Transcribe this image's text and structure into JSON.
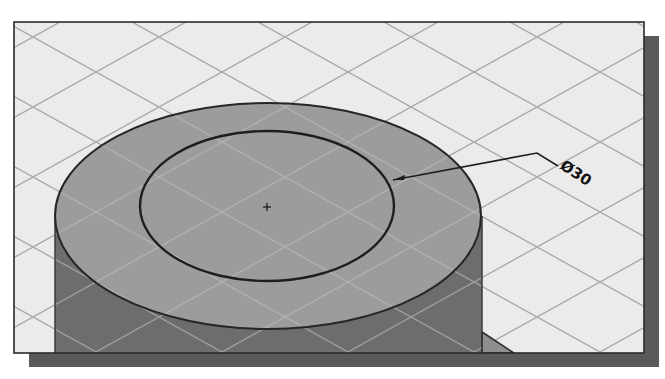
{
  "viewport": {
    "title": "3D model viewport - isometric cylinder sketch",
    "frame": {
      "x": 14,
      "y": 22,
      "width": 630,
      "height": 331
    },
    "shadow": {
      "offset_x": 15,
      "offset_y": 14
    }
  },
  "colors": {
    "background": "#ebebeb",
    "grid_line": "#a8a8a8",
    "frame_border": "#2b2b2b",
    "shadow": "#5a5a5a",
    "cylinder_top": "#9c9c9c",
    "cylinder_side": "#6d6d6d",
    "flange": "#8e8e8e",
    "sketch_line": "#1e1e1e",
    "grid_on_model": "#b6b6b6"
  },
  "model": {
    "outer_top": {
      "cx": 268,
      "cy": 216,
      "rx": 213,
      "ry": 113
    },
    "inner_circle": {
      "cx": 267,
      "cy": 206,
      "rx": 127,
      "ry": 75
    },
    "center_mark": {
      "x": 267,
      "y": 207,
      "glyph": "+"
    }
  },
  "dimension": {
    "label": "Ø30",
    "leader": {
      "from": [
        393,
        180
      ],
      "elbow": [
        537,
        153
      ],
      "to": [
        558,
        166
      ]
    },
    "label_pos": {
      "x": 560,
      "y": 166
    },
    "label_rotation_deg": 33
  }
}
